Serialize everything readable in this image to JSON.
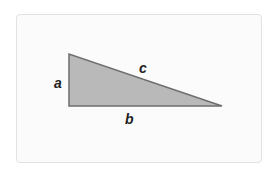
{
  "diagram": {
    "labels": {
      "a": "a",
      "b": "b",
      "c": "c"
    },
    "colors": {
      "fill": "#b9b9b9",
      "stroke": "#6e6e6e",
      "card_background": "#fbfbfb",
      "card_border": "#e2e2e2"
    },
    "triangle": {
      "vertices": [
        [
          69,
          54
        ],
        [
          69,
          106
        ],
        [
          222,
          106
        ]
      ]
    }
  }
}
